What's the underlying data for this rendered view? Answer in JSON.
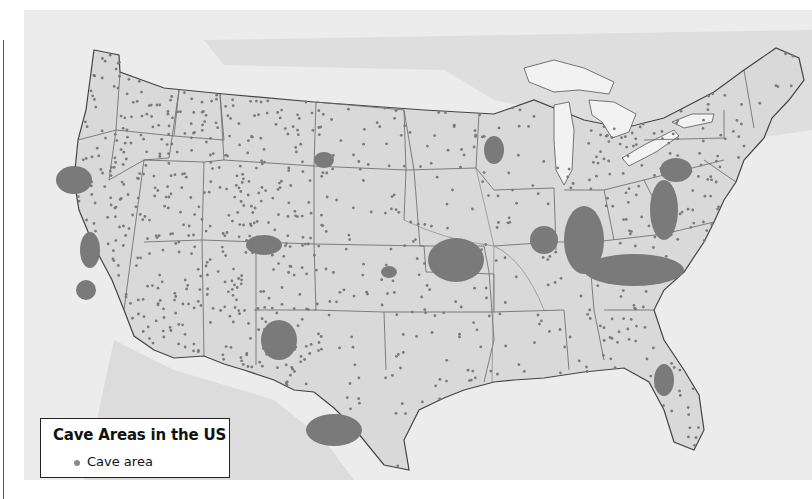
{
  "map": {
    "title": "Cave Areas in the US",
    "subject": "Cave areas in the contiguous United States",
    "colors": {
      "land": "#d9d9d9",
      "water": "#ececec",
      "cave": "#7a7a7a",
      "border": "#555555",
      "lake": "#f2f2f2"
    },
    "regions_with_dense_cave_areas": [
      "Northern California",
      "Southern Appalachians (Tennessee / Kentucky / Virginia)",
      "Missouri Ozarks",
      "Indiana / Kentucky karst",
      "Central Texas (Edwards Plateau)",
      "Southeastern New Mexico",
      "Florida peninsula",
      "Pennsylvania / Maryland valley",
      "Black Hills, South Dakota"
    ]
  },
  "legend": {
    "title": "Cave Areas in the US",
    "items": [
      {
        "label": "Cave area",
        "symbol": "dot",
        "color": "#8a8a8a"
      }
    ]
  }
}
